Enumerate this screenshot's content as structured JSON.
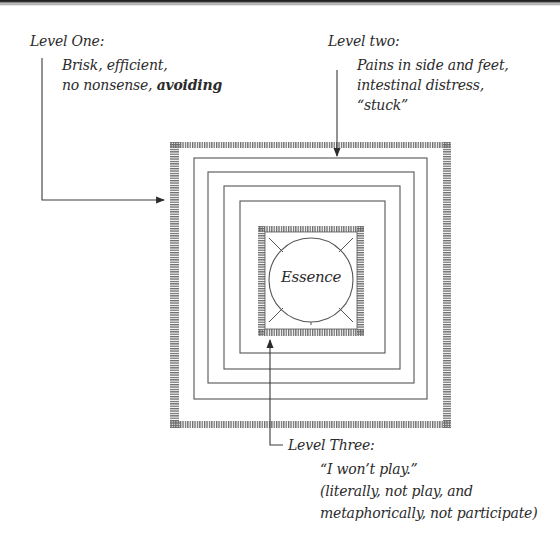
{
  "diagram": {
    "center_label": "Essence",
    "levels": [
      {
        "title": "Level One:",
        "lines": [
          "Brisk, efficient,",
          "no nonsense,"
        ],
        "emphasis": "avoiding",
        "target": "outer-hatched-square"
      },
      {
        "title": "Level two:",
        "lines": [
          "Pains in side and feet,",
          "intestinal distress,"
        ],
        "emphasis": "“stuck”",
        "target": "nested-square-1"
      },
      {
        "title": "Level Three:",
        "lines": [
          "“I won’t play.”",
          "(literally, not play, and",
          "metaphorically, not participate)"
        ],
        "target": "inner-hatched-square"
      }
    ],
    "structure": {
      "outer_hatched_square": true,
      "nested_plain_squares": 4,
      "inner_hatched_square": true,
      "center_circle": true,
      "radial_ticks": 4
    },
    "colors": {
      "ink": "#2b2b2b",
      "line": "#555555",
      "hatch": "#6a6a6a",
      "background": "#ffffff"
    }
  }
}
